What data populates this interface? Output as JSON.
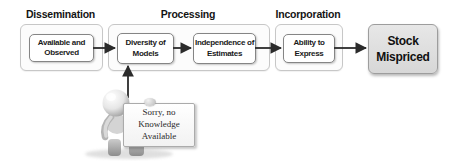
{
  "stages": [
    {
      "label": "Dissemination",
      "boxes": [
        "Available and\nObserved"
      ]
    },
    {
      "label": "Processing",
      "boxes": [
        "Diversity of\nModels",
        "Independence of\nEstimates"
      ]
    },
    {
      "label": "Incorporation",
      "boxes": [
        "Ability to\nExpress"
      ]
    }
  ],
  "result": {
    "label": "Stock\nMispriced"
  },
  "figure": {
    "sign": "Sorry, no\nKnowledge\nAvailable"
  },
  "colors": {
    "background": "#ffffff",
    "container_border": "#c7c7c7",
    "container_fill": "#fcfcfc",
    "node_border": "#858585",
    "node_fill": "#ffffff",
    "result_fill": "#dcdcdc",
    "result_border": "#9d9d9d",
    "arrow": "#2b2b2b",
    "text": "#111111"
  }
}
